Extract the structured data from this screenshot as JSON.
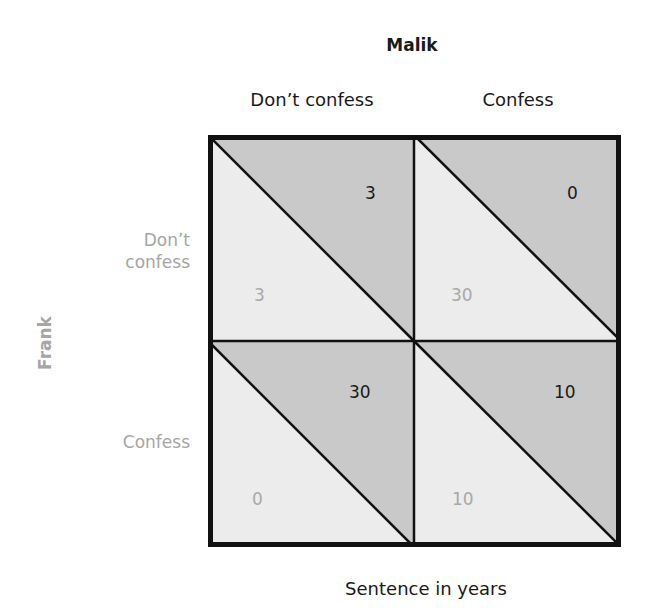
{
  "title": "Malik",
  "column_player": "Malik",
  "row_player": "Frank",
  "columns": [
    "Don’t confess",
    "Confess"
  ],
  "rows": [
    {
      "label_line1": "Don’t",
      "label_line2": "confess"
    },
    {
      "label_line1": "Confess",
      "label_line2": ""
    }
  ],
  "cells": [
    [
      {
        "malik": "3",
        "frank": "3"
      },
      {
        "malik": "0",
        "frank": "30"
      }
    ],
    [
      {
        "malik": "30",
        "frank": "0"
      },
      {
        "malik": "10",
        "frank": "10"
      }
    ]
  ],
  "footer": "Sentence in years",
  "colors": {
    "upper_triangle": "#c9c9c9",
    "lower_triangle": "#ececec",
    "border": "#111111",
    "malik_text": "#1a1a1a",
    "frank_text": "#a8a8a8"
  }
}
